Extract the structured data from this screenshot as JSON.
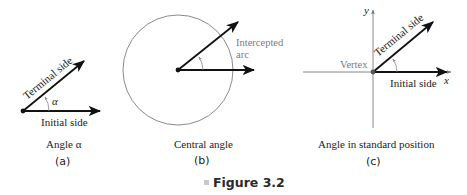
{
  "figure": {
    "caption": "Figure 3.2",
    "panels": [
      {
        "id": "a",
        "title": "Angle α",
        "sublabel": "(a)",
        "labels": {
          "terminal": "Terminal side",
          "initial": "Initial side",
          "angle": "α"
        }
      },
      {
        "id": "b",
        "title": "Central angle",
        "sublabel": "(b)",
        "labels": {
          "arc_line1": "Intercepted",
          "arc_line2": "arc"
        }
      },
      {
        "id": "c",
        "title": "Angle in standard position",
        "sublabel": "(c)",
        "labels": {
          "terminal": "Terminal side",
          "initial": "Initial side",
          "vertex": "Vertex",
          "x_axis": "x",
          "y_axis": "y"
        }
      }
    ]
  },
  "colors": {
    "ink": "#111111",
    "gray": "#7a7a7a",
    "circle": "#8a8a8a",
    "caption_bullet": "#c8c8c8"
  }
}
